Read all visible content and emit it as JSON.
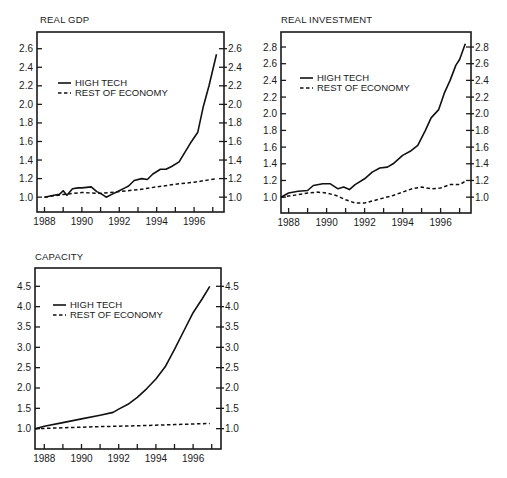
{
  "chart_data": [
    {
      "type": "line",
      "title": "REAL GDP",
      "xlabel": "",
      "ylabel": "",
      "x_ticks": [
        "1988",
        "1990",
        "1992",
        "1994",
        "1996"
      ],
      "y_ticks": [
        "1.0",
        "1.2",
        "1.4",
        "1.6",
        "1.8",
        "2.0",
        "2.2",
        "2.4",
        "2.6"
      ],
      "xlim": [
        1987.6,
        1997.6
      ],
      "ylim": [
        0.84,
        2.78
      ],
      "legend": [
        "HIGH TECH",
        "REST OF ECONOMY"
      ],
      "legend_position": "upper-left",
      "grid": false,
      "dual_y_axis": true,
      "series": [
        {
          "name": "HIGH TECH",
          "style": "solid",
          "x": [
            1988.0,
            1988.5,
            1988.8,
            1989.0,
            1989.2,
            1989.5,
            1989.8,
            1990.0,
            1990.5,
            1990.8,
            1991.0,
            1991.3,
            1991.6,
            1992.0,
            1992.3,
            1992.5,
            1992.8,
            1993.2,
            1993.5,
            1993.8,
            1994.2,
            1994.5,
            1994.8,
            1995.2,
            1995.5,
            1995.8,
            1996.2,
            1996.5,
            1996.8,
            1997.2
          ],
          "values": [
            1.0,
            1.02,
            1.03,
            1.07,
            1.02,
            1.09,
            1.1,
            1.1,
            1.11,
            1.06,
            1.04,
            1.0,
            1.03,
            1.07,
            1.1,
            1.12,
            1.18,
            1.2,
            1.19,
            1.25,
            1.3,
            1.3,
            1.33,
            1.38,
            1.48,
            1.58,
            1.7,
            1.98,
            2.2,
            2.54
          ]
        },
        {
          "name": "REST OF ECONOMY",
          "style": "dashed",
          "x": [
            1988.0,
            1989.0,
            1990.0,
            1991.0,
            1992.0,
            1993.0,
            1994.0,
            1995.0,
            1996.0,
            1997.2
          ],
          "values": [
            1.0,
            1.03,
            1.05,
            1.04,
            1.06,
            1.08,
            1.11,
            1.14,
            1.16,
            1.2
          ]
        }
      ]
    },
    {
      "type": "line",
      "title": "REAL INVESTMENT",
      "xlabel": "",
      "ylabel": "",
      "x_ticks": [
        "1988",
        "1990",
        "1992",
        "1994",
        "1996"
      ],
      "y_ticks": [
        "1.0",
        "1.2",
        "1.4",
        "1.6",
        "1.8",
        "2.0",
        "2.2",
        "2.4",
        "2.6",
        "2.8"
      ],
      "xlim": [
        1987.6,
        1997.6
      ],
      "ylim": [
        0.81,
        2.98
      ],
      "legend": [
        "HIGH TECH",
        "REST OF ECONOMY"
      ],
      "legend_position": "upper-left",
      "grid": false,
      "dual_y_axis": true,
      "series": [
        {
          "name": "HIGH TECH",
          "style": "solid",
          "x": [
            1987.6,
            1988.0,
            1988.5,
            1989.0,
            1989.3,
            1989.8,
            1990.2,
            1990.6,
            1990.9,
            1991.2,
            1991.5,
            1992.0,
            1992.4,
            1992.8,
            1993.2,
            1993.5,
            1994.0,
            1994.4,
            1994.8,
            1995.2,
            1995.5,
            1995.9,
            1996.2,
            1996.5,
            1996.8,
            1997.0,
            1997.3
          ],
          "values": [
            1.0,
            1.05,
            1.07,
            1.08,
            1.14,
            1.16,
            1.16,
            1.1,
            1.12,
            1.09,
            1.15,
            1.22,
            1.3,
            1.35,
            1.36,
            1.4,
            1.5,
            1.55,
            1.62,
            1.8,
            1.95,
            2.05,
            2.25,
            2.4,
            2.58,
            2.65,
            2.84
          ]
        },
        {
          "name": "REST OF ECONOMY",
          "style": "dashed",
          "x": [
            1987.6,
            1988.5,
            1989.0,
            1989.5,
            1990.0,
            1990.5,
            1991.0,
            1991.5,
            1992.0,
            1992.5,
            1993.0,
            1993.5,
            1994.0,
            1994.5,
            1995.0,
            1995.5,
            1996.0,
            1996.5,
            1997.0,
            1997.3
          ],
          "values": [
            1.0,
            1.03,
            1.05,
            1.06,
            1.05,
            1.02,
            0.97,
            0.93,
            0.93,
            0.96,
            0.99,
            1.02,
            1.06,
            1.1,
            1.12,
            1.1,
            1.11,
            1.15,
            1.15,
            1.19
          ]
        }
      ]
    },
    {
      "type": "line",
      "title": "CAPACITY",
      "xlabel": "",
      "ylabel": "",
      "x_ticks": [
        "1988",
        "1990",
        "1992",
        "1994",
        "1996"
      ],
      "y_ticks": [
        "1.0",
        "1.5",
        "2.0",
        "2.5",
        "3.0",
        "3.5",
        "4.0",
        "4.5"
      ],
      "xlim": [
        1987.5,
        1997.5
      ],
      "ylim": [
        0.5,
        4.95
      ],
      "legend": [
        "HIGH TECH",
        "REST OF ECONOMY"
      ],
      "legend_position": "upper-left",
      "grid": false,
      "dual_y_axis": true,
      "series": [
        {
          "name": "HIGH TECH",
          "style": "solid",
          "x": [
            1987.5,
            1988.0,
            1989.0,
            1990.0,
            1991.0,
            1991.7,
            1992.0,
            1992.5,
            1993.0,
            1993.5,
            1994.0,
            1994.5,
            1995.0,
            1995.5,
            1996.0,
            1996.5,
            1996.9
          ],
          "values": [
            1.0,
            1.06,
            1.15,
            1.24,
            1.33,
            1.4,
            1.48,
            1.6,
            1.77,
            1.98,
            2.22,
            2.52,
            2.95,
            3.4,
            3.85,
            4.2,
            4.5
          ]
        },
        {
          "name": "REST OF ECONOMY",
          "style": "dashed",
          "x": [
            1987.5,
            1989.0,
            1991.0,
            1993.0,
            1995.0,
            1996.9
          ],
          "values": [
            1.0,
            1.02,
            1.05,
            1.07,
            1.1,
            1.13
          ]
        }
      ]
    }
  ],
  "panels": {
    "gdp": {
      "title": "REAL GDP"
    },
    "investment": {
      "title": "REAL INVESTMENT"
    },
    "capacity": {
      "title": "CAPACITY"
    }
  },
  "legend": {
    "solid": "HIGH TECH",
    "dashed": "REST OF ECONOMY"
  }
}
